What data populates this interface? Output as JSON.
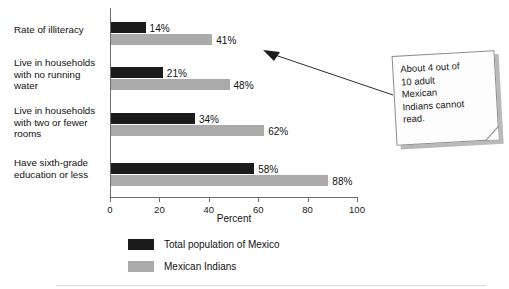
{
  "chart_data": {
    "type": "bar",
    "orientation": "horizontal",
    "title": "",
    "xlabel": "Percent",
    "ylabel": "",
    "xlim": [
      0,
      100
    ],
    "xticks": [
      0,
      20,
      40,
      60,
      80,
      100
    ],
    "grid": false,
    "legend_position": "bottom-left",
    "categories": [
      "Rate of illiteracy",
      "Live in households with no running water",
      "Live in households with two or fewer rooms",
      "Have sixth-grade education or less"
    ],
    "series": [
      {
        "name": "Total population of Mexico",
        "color": "#1b1b1b",
        "values": [
          14,
          21,
          34,
          58
        ],
        "value_labels": [
          "14%",
          "21%",
          "34%",
          "58%"
        ]
      },
      {
        "name": "Mexican Indians",
        "color": "#aaaaaa",
        "values": [
          41,
          48,
          62,
          88
        ],
        "value_labels": [
          "41%",
          "48%",
          "62%",
          "88%"
        ]
      }
    ],
    "annotations": [
      {
        "text": "About 4 out of 10 adult Mexican Indians cannot read.",
        "points_to_category": "Rate of illiteracy",
        "points_to_series": "Mexican Indians"
      }
    ]
  },
  "axis": {
    "x_title": "Percent",
    "tick_labels": [
      "0",
      "20",
      "40",
      "60",
      "80",
      "100"
    ]
  },
  "category_labels": [
    {
      "lines": [
        "Rate of illiteracy"
      ]
    },
    {
      "lines": [
        "Live in households",
        "with no running",
        "water"
      ]
    },
    {
      "lines": [
        "Live in households",
        "with two or fewer",
        "rooms"
      ]
    },
    {
      "lines": [
        "Have sixth-grade",
        "education or less"
      ]
    }
  ],
  "legend": {
    "items": [
      {
        "label": "Total population of Mexico",
        "color": "#1b1b1b"
      },
      {
        "label": "Mexican Indians",
        "color": "#aaaaaa"
      }
    ]
  },
  "callout": {
    "lines": [
      "About 4 out of",
      "10 adult",
      "Mexican",
      "Indians cannot",
      "read."
    ]
  }
}
